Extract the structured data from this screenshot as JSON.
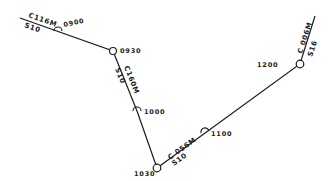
{
  "diagram": {
    "type": "track-plot",
    "colors": {
      "line": "#1a1a1a",
      "background": "#ffffff"
    },
    "legs": [
      {
        "course": "C116M",
        "speed": "S10"
      },
      {
        "course": "C160M",
        "speed": "S10"
      },
      {
        "course": "C 056M",
        "speed": "S10"
      },
      {
        "course": "C 006M",
        "speed": "S16"
      }
    ],
    "times": [
      "0900",
      "0930",
      "1000",
      "1030",
      "1100",
      "1200"
    ]
  }
}
